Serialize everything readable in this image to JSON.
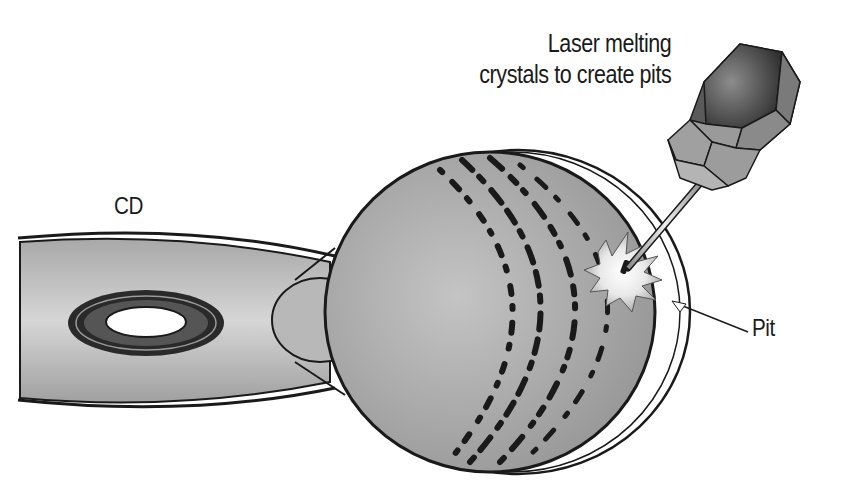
{
  "diagram": {
    "labels": {
      "laser_line1": "Laser melting",
      "laser_line2": "crystals to create pits",
      "cd": "CD",
      "pit": "Pit"
    },
    "colors": {
      "outline": "#1a1a1a",
      "disc_fill_light": "#d4d4d4",
      "disc_fill_dark": "#9a9a9a",
      "hub_ring": "#2a2a2a",
      "laser_dark": "#3a3a3a",
      "laser_mid": "#8a8a8a",
      "beam": "#c8c8c8",
      "flash": "#ffffff"
    }
  }
}
